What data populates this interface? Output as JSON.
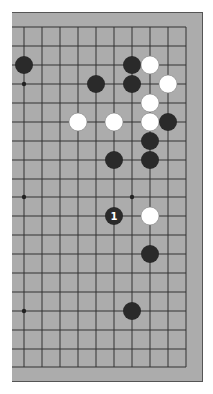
{
  "diagram": {
    "type": "go-board-fragment",
    "board_color": "#acacac",
    "line_color": "#333333",
    "grid": {
      "columns_x": [
        24,
        42,
        60,
        78,
        96,
        114,
        132,
        150,
        168,
        186
      ],
      "rows_y": [
        27,
        46,
        65,
        84,
        103,
        122,
        141,
        160,
        179,
        197,
        216,
        235,
        254,
        273,
        292,
        311,
        330,
        349,
        367
      ]
    },
    "star_points": [
      {
        "col": 0,
        "row": 3
      },
      {
        "col": 0,
        "row": 9
      },
      {
        "col": 6,
        "row": 9
      },
      {
        "col": 0,
        "row": 15
      }
    ],
    "stones": [
      {
        "color": "black",
        "col": 0,
        "row": 2
      },
      {
        "color": "black",
        "col": 6,
        "row": 2
      },
      {
        "color": "white",
        "col": 7,
        "row": 2
      },
      {
        "color": "black",
        "col": 4,
        "row": 3
      },
      {
        "color": "black",
        "col": 6,
        "row": 3
      },
      {
        "color": "white",
        "col": 8,
        "row": 3
      },
      {
        "color": "white",
        "col": 7,
        "row": 4
      },
      {
        "color": "white",
        "col": 3,
        "row": 5
      },
      {
        "color": "white",
        "col": 5,
        "row": 5
      },
      {
        "color": "white",
        "col": 7,
        "row": 5
      },
      {
        "color": "black",
        "col": 8,
        "row": 5
      },
      {
        "color": "black",
        "col": 7,
        "row": 6
      },
      {
        "color": "black",
        "col": 5,
        "row": 7
      },
      {
        "color": "black",
        "col": 7,
        "row": 7
      },
      {
        "color": "black",
        "col": 5,
        "row": 10,
        "label": "1"
      },
      {
        "color": "white",
        "col": 7,
        "row": 10
      },
      {
        "color": "black",
        "col": 7,
        "row": 12
      },
      {
        "color": "black",
        "col": 6,
        "row": 15
      }
    ]
  }
}
